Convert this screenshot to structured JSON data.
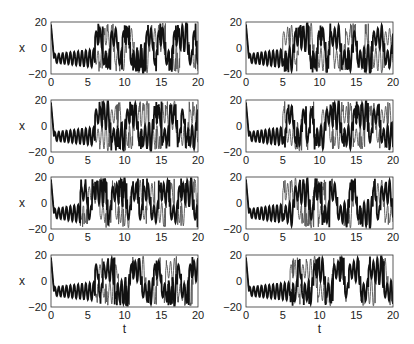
{
  "chart_data": {
    "type": "line",
    "layout": {
      "rows": 4,
      "cols": 2
    },
    "xlabel": "t",
    "ylabel": "x",
    "xlim": [
      0,
      20
    ],
    "ylim": [
      -20,
      20
    ],
    "xticks": [
      0,
      5,
      10,
      15,
      20
    ],
    "yticks": [
      -20,
      0,
      20
    ],
    "xtick_labels": [
      "0",
      "5",
      "10",
      "15",
      "20"
    ],
    "ytick_labels": [
      "-20",
      "0",
      "20"
    ],
    "panels": [
      {
        "row": 1,
        "col": 1,
        "series": [
          {
            "name": "thick",
            "divergence_t": 6
          },
          {
            "name": "thin"
          }
        ]
      },
      {
        "row": 1,
        "col": 2,
        "series": [
          {
            "name": "thick",
            "divergence_t": 5
          },
          {
            "name": "thin"
          }
        ]
      },
      {
        "row": 2,
        "col": 1,
        "series": [
          {
            "name": "thick",
            "divergence_t": 6
          },
          {
            "name": "thin"
          }
        ]
      },
      {
        "row": 2,
        "col": 2,
        "series": [
          {
            "name": "thick",
            "divergence_t": 5
          },
          {
            "name": "thin"
          }
        ]
      },
      {
        "row": 3,
        "col": 1,
        "series": [
          {
            "name": "thick",
            "divergence_t": 4
          },
          {
            "name": "thin"
          }
        ]
      },
      {
        "row": 3,
        "col": 2,
        "series": [
          {
            "name": "thick",
            "divergence_t": 5
          },
          {
            "name": "thin"
          }
        ]
      },
      {
        "row": 4,
        "col": 1,
        "series": [
          {
            "name": "thick",
            "divergence_t": 6
          },
          {
            "name": "thin"
          }
        ]
      },
      {
        "row": 4,
        "col": 2,
        "series": [
          {
            "name": "thick",
            "divergence_t": 6
          },
          {
            "name": "thin"
          }
        ]
      }
    ]
  },
  "labels": {
    "x": "x",
    "t": "t"
  }
}
